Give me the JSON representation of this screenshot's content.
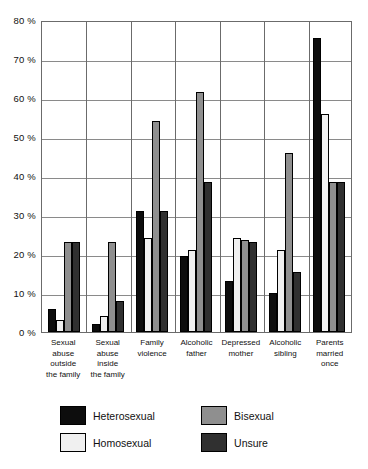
{
  "chart_data": {
    "type": "bar",
    "title": "",
    "subtitle": "",
    "xlabel": "",
    "ylabel": "",
    "ylim": [
      0,
      80
    ],
    "ytick_step": 10,
    "ytick_labels": [
      "80 %",
      "70 %",
      "60 %",
      "50 %",
      "40 %",
      "30 %",
      "20 %",
      "10 %",
      "0 %"
    ],
    "ytick_values": [
      80,
      70,
      60,
      50,
      40,
      30,
      20,
      10,
      0
    ],
    "grid": "horizontal-and-vertical",
    "legend_position": "bottom",
    "categories": [
      "Sexual abuse outside the family",
      "Sexual abuse inside the family",
      "Family violence",
      "Alcoholic father",
      "Depressed mother",
      "Alcoholic sibling",
      "Parents married once"
    ],
    "categories_lines": [
      [
        "Sexual",
        "abuse",
        "outside",
        "the family"
      ],
      [
        "Sexual",
        "abuse",
        "inside",
        "the family"
      ],
      [
        "Family",
        "violence"
      ],
      [
        "Alcoholic",
        "father"
      ],
      [
        "Depressed",
        "mother"
      ],
      [
        "Alcoholic",
        "sibling"
      ],
      [
        "Parents",
        "married",
        "once"
      ]
    ],
    "series": [
      {
        "name": "Heterosexual",
        "color": "#0d0d0d",
        "values": [
          6,
          2,
          31,
          19.5,
          13,
          10,
          75.5
        ]
      },
      {
        "name": "Homosexual",
        "color": "#f0f0f0",
        "values": [
          3,
          4,
          24,
          21,
          24,
          21,
          56
        ]
      },
      {
        "name": "Bisexual",
        "color": "#8f8f8f",
        "values": [
          23,
          23,
          54,
          61.5,
          23.5,
          46,
          38.5
        ]
      },
      {
        "name": "Unsure",
        "color": "#303030",
        "values": [
          23,
          8,
          31,
          38.5,
          23,
          15.5,
          38.5
        ]
      }
    ]
  }
}
